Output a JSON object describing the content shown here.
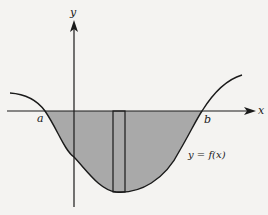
{
  "figure": {
    "labels": {
      "y_axis": "y",
      "x_axis": "x",
      "left_bound": "a",
      "right_bound": "b",
      "curve": "y = f(x)"
    },
    "colors": {
      "shading": "#a9a9a9",
      "stroke": "#1a1a1a",
      "background": "#f4f3f1"
    }
  }
}
